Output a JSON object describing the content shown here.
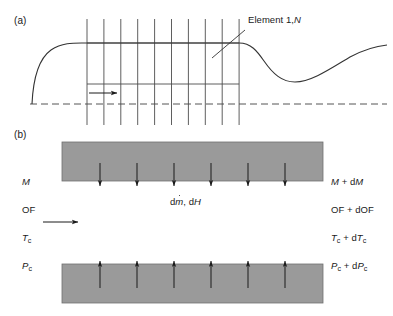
{
  "figure": {
    "panels": [
      {
        "tag": "(a)",
        "x": 14,
        "y": 16
      },
      {
        "tag": "(b)",
        "x": 14,
        "y": 130
      }
    ]
  },
  "panel_a": {
    "callout_label_prefix": "Element 1,",
    "callout_label_italic": "N",
    "callout_label_x": 248,
    "callout_label_y": 16,
    "leader_line": {
      "x1": 244,
      "y1": 31,
      "x2": 213,
      "y2": 57
    },
    "flow_arrow": {
      "x1": 89,
      "y1": 93,
      "x2": 119,
      "y2": 93
    },
    "baseline": {
      "x1": 30,
      "y1": 104,
      "x2": 387,
      "y2": 104
    },
    "grid": {
      "count": 10,
      "x_start": 87,
      "x_spacing": 16.9,
      "y_top": 19,
      "y_bottom": 125
    },
    "top_rail": {
      "x1": 87,
      "y1": 43,
      "x2": 239,
      "y2": 43
    },
    "mid_rail": {
      "x1": 87,
      "y1": 84,
      "x2": 239,
      "y2": 84
    },
    "curve_path": "M 32,104 C 33,80 38,58 52,49 C 64,42 76,43 87,43 L 239,43 C 252,43 258,52 266,62 C 275,74 283,82 296,82 C 312,82 330,68 350,57 C 365,49 377,46 387,45"
  },
  "panel_b": {
    "boxes": [
      {
        "name": "upper-block",
        "x": 62,
        "y": 142,
        "w": 261,
        "h": 39
      },
      {
        "name": "lower-block",
        "x": 62,
        "y": 264,
        "w": 261,
        "h": 39
      }
    ],
    "box_fill": "#9a9a9a",
    "box_stroke": "#6e6e6e",
    "arrow_count": 6,
    "arrow_x_start": 100,
    "arrow_x_spacing": 37,
    "down_arrows": {
      "y_top": 163,
      "y_tip": 188
    },
    "up_arrows": {
      "y_base": 288,
      "y_tip": 259
    },
    "flow_arrow": {
      "x1": 43,
      "y1": 222,
      "x2": 80,
      "y2": 222
    },
    "center_label": {
      "x": 170,
      "y": 198,
      "prefix": "d",
      "mdot": "m",
      "mid": ", d",
      "italic_h": "H"
    },
    "left_labels": [
      {
        "name": "label-M",
        "x": 22,
        "y": 178,
        "italic": "M",
        "sub": "",
        "rest": ""
      },
      {
        "name": "label-OF",
        "x": 22,
        "y": 206,
        "italic": "",
        "sub": "",
        "rest": "OF"
      },
      {
        "name": "label-Tc",
        "x": 22,
        "y": 234,
        "italic": "T",
        "sub": "c",
        "rest": ""
      },
      {
        "name": "label-Pc",
        "x": 22,
        "y": 262,
        "italic": "P",
        "sub": "c",
        "rest": ""
      }
    ],
    "right_labels": [
      {
        "name": "label-M-dM",
        "x": 331,
        "y": 178
      },
      {
        "name": "label-OF-dOF",
        "x": 331,
        "y": 206
      },
      {
        "name": "label-Tc-dTc",
        "x": 331,
        "y": 234
      },
      {
        "name": "label-Pc-dPc",
        "x": 331,
        "y": 262
      }
    ]
  },
  "text": {
    "panel_a_tag": "(a)",
    "panel_b_tag": "(b)",
    "element_prefix": "Element 1,",
    "element_N": "N",
    "dm_d": "d",
    "dm_m": "m",
    "dm_mid": ", d",
    "dm_H": "H",
    "M": "M",
    "OF": "OF",
    "T": "T",
    "P": "P",
    "sub_c": "c",
    "plus": " + ",
    "d": "d",
    "M_out_italic": "M",
    "OF_out": "OF + dOF",
    "T_out": "T",
    "P_out": "P"
  },
  "colors": {
    "line": "#1a1a1a",
    "curve": "#333333",
    "grid": "#4d4d4d",
    "dashed": "#555555",
    "block_fill": "#9a9a9a",
    "block_stroke": "#707070",
    "background": "#ffffff"
  }
}
